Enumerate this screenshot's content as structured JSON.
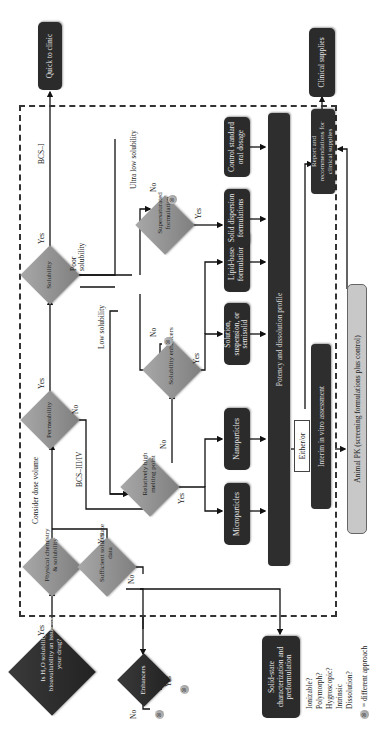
{
  "diagram": {
    "orientation": "rotated 90 degrees counter-clockwise",
    "start": {
      "question": "Is H₂O solubility or bioavailability an issue for your drug?",
      "yes": "Yes"
    },
    "enhancers": {
      "label": "Enhancers",
      "yes": "Yes",
      "no": "No"
    },
    "solid_state_box": {
      "label": "Solid-state characterization and preformulation"
    },
    "solid_state_questions": [
      "Ionizable?",
      "Polymorph?",
      "Hygroscopic?",
      "Intrinsic",
      "Dissolution?"
    ],
    "legend": {
      "symbol": "⊗",
      "text": "= different approach"
    },
    "physical_chemistry": {
      "label": "Physical chemistry & solubility"
    },
    "sufficient_data": {
      "label": "Sufficient solid-state data",
      "yes": "Yes",
      "no": "No"
    },
    "consider_dose": "Consider dose volume",
    "permeability": {
      "label": "Permeability",
      "yes": "Yes",
      "no": "No",
      "bcs": "BCS–III/IV"
    },
    "solubility": {
      "label": "Solubility",
      "yes": "Yes",
      "poor": "Poor solubility",
      "bcs": "BCS–I"
    },
    "quick_to_clinic": "Quick to clinic",
    "low_solubility": "Low solubility",
    "ultra_low_solubility": "Ultra low solubility",
    "melting_point": {
      "label": "Relatively high melting point",
      "yes": "Yes",
      "no": "No"
    },
    "solubility_enhancers": {
      "label": "Solubility enhancers",
      "yes": "Yes",
      "no": "No"
    },
    "supersaturated": {
      "label": "Supersaturated formulation",
      "yes": "Yes",
      "no": "No"
    },
    "formulations": {
      "microparticles": "Microparticles",
      "nanoparticles": "Nanoparticles",
      "solution": "Solution, suspension, or semisolid",
      "lipid": "Lipid-based formulations",
      "solid_dispersion": "Solid dispersion formulations",
      "control": "Control standard oral dosage"
    },
    "potency_profile": "Potency and dissolution profile",
    "either_or": "Either/or",
    "interim": "Interim in vitro assessment",
    "animal_pk": "Animal PK (screening formulations plus control)",
    "report": "Report and recommendations for clinical supplies",
    "clinical_supplies": "Clinical supplies"
  }
}
